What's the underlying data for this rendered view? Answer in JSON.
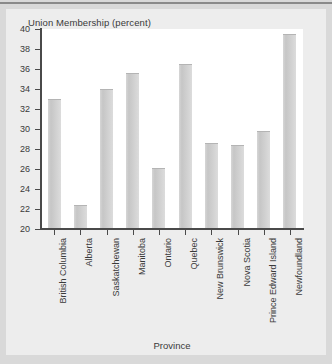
{
  "chart_data": {
    "type": "bar",
    "title": "Union Membership (percent)",
    "xlabel": "Province",
    "ylabel": "",
    "categories": [
      "British Columbia",
      "Alberta",
      "Saskatchewan",
      "Manitoba",
      "Ontario",
      "Quebec",
      "New Brunswick",
      "Nova Scotia",
      "Prince Edward Island",
      "Newfoundland"
    ],
    "values": [
      33.0,
      22.4,
      34.0,
      35.6,
      26.1,
      36.5,
      28.6,
      28.4,
      29.8,
      39.5
    ],
    "ylim": [
      20,
      40
    ],
    "yticks": [
      20,
      22,
      24,
      26,
      28,
      30,
      32,
      34,
      36,
      38,
      40
    ],
    "ytick_labels": [
      "20",
      "22",
      "24",
      "26",
      "28",
      "30",
      "32",
      "34",
      "36",
      "38",
      "40"
    ],
    "grid": false,
    "legend": null,
    "bar_color": "#cdcdcd",
    "axis_color": "#4a4a4a",
    "plot_background": "#ffffff",
    "figure_background": "#ededed",
    "page_background": "#d9d9d9"
  }
}
